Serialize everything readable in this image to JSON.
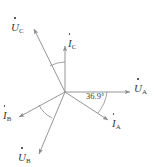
{
  "figure": {
    "background": "#ffffff",
    "line_color": "#8a8a8a",
    "text_color": "#3a3a3a",
    "width": 157,
    "height": 167
  },
  "origin": {
    "x": 65,
    "y": 92
  },
  "angle_annotation": {
    "value": "36.9",
    "unit": "°",
    "text": "36.9°",
    "between": [
      "U_A",
      "I_A"
    ],
    "label_x": 86,
    "label_y": 92
  },
  "phasors": [
    {
      "id": "U_A",
      "symbol": "U",
      "subscript": "A",
      "has_dot": true,
      "kind": "voltage",
      "angle_deg": 0,
      "tip": {
        "x": 132,
        "y": 92
      },
      "label": {
        "x": 134,
        "y": 79
      }
    },
    {
      "id": "U_B",
      "symbol": "U",
      "subscript": "B",
      "has_dot": true,
      "kind": "voltage",
      "angle_deg": -120,
      "tip": {
        "x": 38,
        "y": 156
      },
      "label": {
        "x": 18,
        "y": 148
      }
    },
    {
      "id": "U_C",
      "symbol": "U",
      "subscript": "C",
      "has_dot": true,
      "kind": "voltage",
      "angle_deg": 120,
      "tip": {
        "x": 33,
        "y": 27
      },
      "label": {
        "x": 11,
        "y": 18
      }
    },
    {
      "id": "I_A",
      "symbol": "I",
      "subscript": "A",
      "has_dot": true,
      "kind": "current",
      "angle_deg": -36.9,
      "tip": {
        "x": 110,
        "y": 122
      },
      "label": {
        "x": 112,
        "y": 114
      }
    },
    {
      "id": "I_B",
      "symbol": "I",
      "subscript": "B",
      "has_dot": true,
      "kind": "current",
      "angle_deg": -156.9,
      "tip": {
        "x": 17,
        "y": 118
      },
      "label": {
        "x": 3,
        "y": 106
      }
    },
    {
      "id": "I_C",
      "symbol": "I",
      "subscript": "C",
      "has_dot": true,
      "kind": "current",
      "angle_deg": 90,
      "tip": {
        "x": 65,
        "y": 44
      },
      "label": {
        "x": 68,
        "y": 34
      }
    }
  ]
}
